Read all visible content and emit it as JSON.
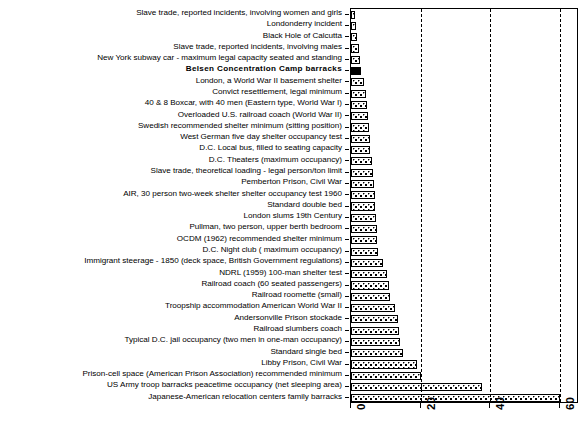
{
  "chart_data": {
    "type": "bar",
    "orientation": "horizontal",
    "title": "",
    "xlabel": "",
    "ylabel": "",
    "xlim": [
      0,
      65.5
    ],
    "xticks": [
      0,
      20,
      40,
      60
    ],
    "xticklabels": [
      "0",
      "20",
      "40",
      "60"
    ],
    "grid": "vertical dashed at 20, 40, 60",
    "legend": "none",
    "categories": [
      "Slave trade, reported incidents, involving women and girls",
      "Londonderry incident",
      "Black Hole of Calcutta",
      "Slave trade, reported incidents, involving males",
      "New York subway car - maximum legal capacity seated and standing",
      "Belsen  Concentration  Camp  barracks",
      "London, a World War II basement shelter",
      "Convict resettlement, legal minimum",
      "40 & 8 Boxcar, with 40 men (Eastern type, World War I)",
      "Overloaded U.S. railroad coach (World War II)",
      "Swedish recommended shelter minimum (sitting position)",
      "West German five day shelter occupancy test",
      "D.C. Local bus, filled to seating capacity",
      "D.C. Theaters (maximum occupancy)",
      "Slave trade, theoretical loading - legal person/ton limit",
      "Pemberton Prison, Civil War",
      "AIR, 30 person two-week shelter shelter occupancy test 1960",
      "Standard double bed",
      "London slums 19th Century",
      "Pullman, two person, upper berth bedroom",
      "OCDM (1962) recommended shelter minimum",
      "D.C. Night club ( maximum occupancy)",
      "Immigrant steerage - 1850 (deck space, British Government regulations)",
      "NDRL (1959) 100-man shelter test",
      "Railroad coach (60 seated passengers)",
      "Railroad roomette (small)",
      "Troopship accommodation American World War II",
      "Andersonville Prison stockade",
      "Railroad slumbers coach",
      "Typical D.C. jail occupancy (two men in one-man occupancy)",
      "Standard single bed",
      "Libby Prison, Civil War",
      "Prison-cell space (American Prison Association) recommended minimum",
      "US Army troop barracks peacetime occupancy  (net sleeping area)",
      "Japanese-American relocation centers family barracks"
    ],
    "values": [
      1.2,
      1.4,
      1.8,
      2.2,
      2.6,
      3.0,
      3.6,
      4.4,
      4.6,
      4.8,
      5.2,
      5.4,
      5.6,
      6.0,
      6.4,
      6.6,
      6.8,
      7.0,
      7.2,
      7.4,
      7.6,
      7.8,
      9.2,
      10.4,
      10.8,
      11.2,
      12.6,
      13.6,
      13.8,
      14.0,
      15.0,
      19.0,
      20.0,
      37.5,
      60.0
    ],
    "bar_styles": [
      "dotted",
      "dotted",
      "dotted",
      "dotted",
      "dotted",
      "solid",
      "dotted",
      "dotted",
      "dotted",
      "dotted",
      "dotted",
      "dotted",
      "dotted",
      "dotted",
      "dotted",
      "dotted",
      "dotted",
      "dotted",
      "dotted",
      "dotted",
      "dotted",
      "dotted",
      "dotted",
      "dotted",
      "dotted",
      "dotted",
      "dotted",
      "dotted",
      "dotted",
      "dotted",
      "dotted",
      "dotted",
      "dotted",
      "dotted",
      "dotted"
    ],
    "highlight_index": 5,
    "colors": {
      "bar_fill": "#ffffff",
      "bar_edge": "#000000",
      "highlight_fill": "#000000",
      "background": "#ffffff",
      "gridline": "#000000",
      "text": "#000000"
    }
  }
}
